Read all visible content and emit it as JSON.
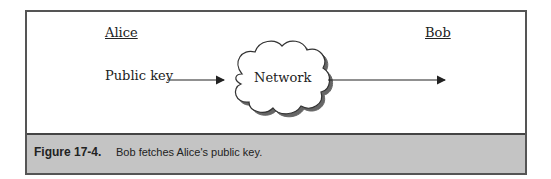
{
  "diagram": {
    "actors": [
      {
        "name": "Alice"
      },
      {
        "name": "Bob"
      }
    ],
    "nodes": {
      "source_label": "Public key",
      "cloud_label": "Network"
    },
    "edges": [
      {
        "from": "Public key",
        "to": "Network"
      },
      {
        "from": "Network",
        "to": "Bob"
      }
    ]
  },
  "caption": {
    "number": "Figure 17-4.",
    "text": "Bob fetches Alice's public key."
  }
}
